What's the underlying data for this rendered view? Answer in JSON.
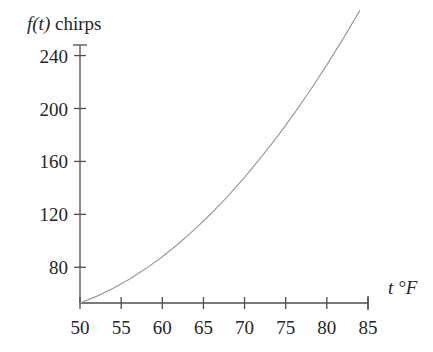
{
  "chart_data": {
    "type": "line",
    "title": "",
    "subtitle": "",
    "xlabel": "t °F",
    "ylabel": "f(t) chirps",
    "xlabel_parts": {
      "symbol": "t",
      "unit": "°F"
    },
    "ylabel_parts": {
      "symbol": "f(t)",
      "unit": "chirps"
    },
    "xlim": [
      50,
      85
    ],
    "ylim": [
      53,
      248
    ],
    "xticks": [
      50,
      55,
      60,
      65,
      70,
      75,
      80,
      85
    ],
    "xtick_labels": [
      "50",
      "55",
      "60",
      "65",
      "70",
      "75",
      "80",
      "85"
    ],
    "yticks": [
      80,
      120,
      160,
      200,
      240
    ],
    "ytick_labels": [
      "80",
      "120",
      "160",
      "200",
      "240"
    ],
    "grid": false,
    "legend": false,
    "series": [
      {
        "name": "chirps",
        "color": "#9a9a9a",
        "x": [
          50,
          52,
          54,
          56,
          58,
          60,
          62,
          64,
          66,
          68,
          70,
          72,
          74,
          76,
          78,
          80,
          82,
          84
        ],
        "y": [
          53,
          58,
          64,
          71,
          79,
          88,
          98,
          109,
          121,
          134,
          148,
          163,
          179,
          196,
          214,
          233,
          253,
          274
        ]
      }
    ],
    "axis_color": "#4d4d4d",
    "text_color": "#262626",
    "background": "#ffffff"
  },
  "axes": {
    "y_axis_name": "chirps-axis",
    "x_axis_name": "temperature-axis"
  }
}
